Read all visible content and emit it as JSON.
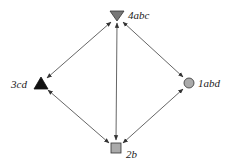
{
  "diagram": {
    "type": "directed-graph",
    "nodes": [
      {
        "id": "4abc",
        "label": "4abc",
        "shape": "triangle-down",
        "fill": "#777777",
        "x": 117,
        "y": 16
      },
      {
        "id": "3cd",
        "label": "3cd",
        "shape": "triangle-up",
        "fill": "#111111",
        "x": 41,
        "y": 84
      },
      {
        "id": "1abd",
        "label": "1abd",
        "shape": "circle",
        "fill": "#aaaaaa",
        "x": 189,
        "y": 83
      },
      {
        "id": "2b",
        "label": "2b",
        "shape": "square",
        "fill": "#aaaaaa",
        "x": 116,
        "y": 148
      }
    ],
    "edges": [
      {
        "from": "4abc",
        "to": "3cd",
        "bidirectional": true
      },
      {
        "from": "4abc",
        "to": "1abd",
        "bidirectional": true
      },
      {
        "from": "4abc",
        "to": "2b",
        "bidirectional": true
      },
      {
        "from": "3cd",
        "to": "2b",
        "bidirectional": true
      },
      {
        "from": "1abd",
        "to": "2b",
        "bidirectional": true
      }
    ],
    "colors": {
      "edge": "#555555",
      "label": "#222222",
      "background": "#ffffff"
    }
  }
}
